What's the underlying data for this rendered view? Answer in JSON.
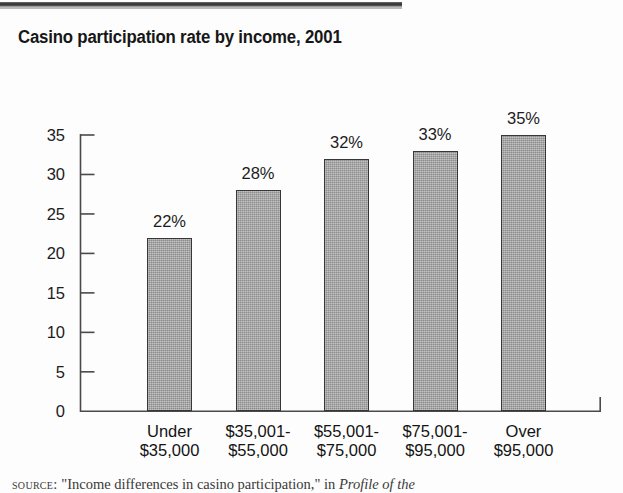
{
  "page": {
    "title": "Casino participation rate by income, 2001",
    "source_prefix": "source:",
    "source_article": "\"Income differences in casino participation,\"",
    "source_connector": "in",
    "source_publication": "Profile of the"
  },
  "chart_data": {
    "type": "bar",
    "title": "Casino participation rate by income, 2001",
    "xlabel": "",
    "ylabel": "",
    "ylim": [
      0,
      35
    ],
    "yticks": [
      0,
      5,
      10,
      15,
      20,
      25,
      30,
      35
    ],
    "ytick_labels": [
      "0",
      "5",
      "10",
      "15",
      "20",
      "25",
      "30",
      "35"
    ],
    "grid": false,
    "legend": "none",
    "categories": [
      "Under $35,000",
      "$35,001-$55,000",
      "$55,001-$75,000",
      "$75,001-$95,000",
      "Over $95,000"
    ],
    "category_lines": [
      [
        "Under",
        "$35,000"
      ],
      [
        "$35,001-",
        "$55,000"
      ],
      [
        "$55,001-",
        "$75,000"
      ],
      [
        "$75,001-",
        "$95,000"
      ],
      [
        "Over",
        "$95,000"
      ]
    ],
    "values": [
      22,
      28,
      32,
      33,
      35
    ],
    "value_labels": [
      "22%",
      "28%",
      "32%",
      "33%",
      "35%"
    ],
    "colors": {
      "bar_fill": "#9c9c9c",
      "bar_edge": "#373737",
      "axis": "#4a4a4a",
      "text": "#1a1a1a",
      "background": "#ffffff"
    }
  }
}
